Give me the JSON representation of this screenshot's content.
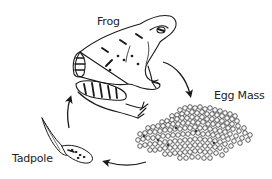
{
  "diagram": {
    "stages": [
      {
        "id": "frog",
        "label": "Frog"
      },
      {
        "id": "egg-mass",
        "label": "Egg Mass"
      },
      {
        "id": "tadpole",
        "label": "Tadpole"
      }
    ],
    "cycle_order": [
      "Frog",
      "Egg Mass",
      "Tadpole",
      "Frog"
    ],
    "colors": {
      "ink": "#1a1a1a",
      "background": "#ffffff"
    }
  }
}
